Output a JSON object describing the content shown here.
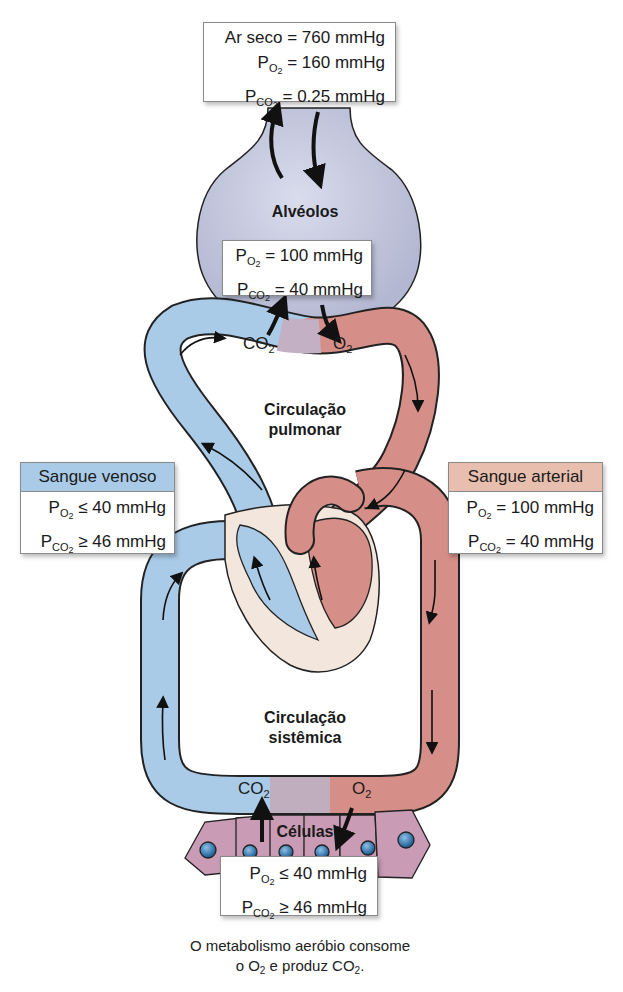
{
  "dry_air_box": {
    "line1": "Ar seco = 760 mmHg",
    "po2_value": "= 160 mmHg",
    "pco2_value": "= 0.25 mmHg"
  },
  "alveoli": {
    "label": "Alvéolos",
    "po2_value": "= 100 mmHg",
    "pco2_value": "= 40 mmHg"
  },
  "pulmonary_exchange": {
    "co2": "CO",
    "o2": "O"
  },
  "pulmonary_circulation": {
    "line1": "Circulação",
    "line2": "pulmonar"
  },
  "venous_blood": {
    "header": "Sangue venoso",
    "po2_value": "≤ 40 mmHg",
    "pco2_value": "≥ 46 mmHg"
  },
  "arterial_blood": {
    "header": "Sangue arterial",
    "po2_value": "= 100 mmHg",
    "pco2_value": "= 40 mmHg"
  },
  "systemic_circulation": {
    "line1": "Circulação",
    "line2": "sistêmica"
  },
  "systemic_exchange": {
    "co2": "CO",
    "o2": "O"
  },
  "cells": {
    "label": "Células",
    "po2_value": "≤ 40 mmHg",
    "pco2_value": "≥ 46 mmHg"
  },
  "caption": {
    "line1": "O metabolismo aeróbio consome",
    "line2_a": "o O",
    "line2_b": " e produz CO",
    "line2_c": "."
  },
  "symbols": {
    "P": "P",
    "O": "O",
    "CO": "CO",
    "sub2": "2"
  },
  "colors": {
    "venous": "#a9cbe8",
    "arterial": "#d9928d",
    "alveolus": "#c8cbe0",
    "cells": "#c99bb5",
    "nucleus": "#3d7fb5",
    "heart_bg": "#f3e6dc",
    "venous_header": "#a9cbe8",
    "arterial_header": "#e8bfae"
  }
}
